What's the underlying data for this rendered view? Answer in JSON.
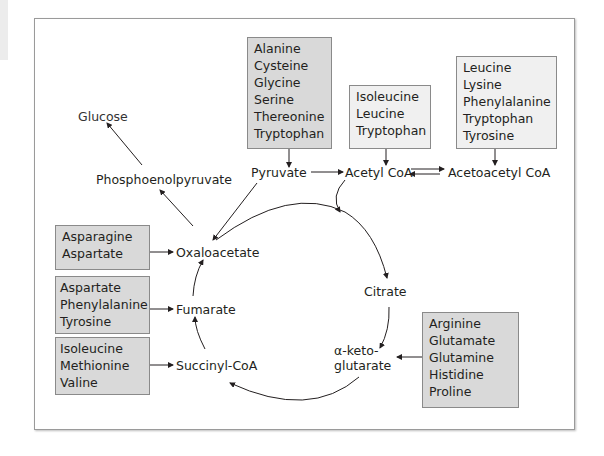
{
  "diagram": {
    "type": "metabolic-pathway",
    "nodes": {
      "glucose": "Glucose",
      "phosphoenolpyruvate": "Phosphoenolpyruvate",
      "pyruvate": "Pyruvate",
      "acetyl_coa": "Acetyl CoA",
      "acetoacetyl_coa": "Acetoacetyl CoA",
      "oxaloacetate": "Oxaloacetate",
      "citrate": "Citrate",
      "alpha_ketoglutarate_line1": "α-keto-",
      "alpha_ketoglutarate_line2": "glutarate",
      "succinyl_coa": "Succinyl-CoA",
      "fumarate": "Fumarate"
    },
    "boxes": {
      "pyruvate_sources": [
        "Alanine",
        "Cysteine",
        "Glycine",
        "Serine",
        "Thereonine",
        "Tryptophan"
      ],
      "acetyl_coa_sources": [
        "Isoleucine",
        "Leucine",
        "Tryptophan"
      ],
      "acetoacetyl_coa_sources": [
        "Leucine",
        "Lysine",
        "Phenylalanine",
        "Tryptophan",
        "Tyrosine"
      ],
      "oxaloacetate_sources": [
        "Asparagine",
        "Aspartate"
      ],
      "fumarate_sources": [
        "Aspartate",
        "Phenylalanine",
        "Tyrosine"
      ],
      "succinyl_coa_sources": [
        "Isoleucine",
        "Methionine",
        "Valine"
      ],
      "alpha_ketoglutarate_sources": [
        "Arginine",
        "Glutamate",
        "Glutamine",
        "Histidine",
        "Proline"
      ]
    },
    "edges": [
      {
        "from": "Alanine/Cysteine/Glycine/Serine/Thereonine/Tryptophan",
        "to": "Pyruvate"
      },
      {
        "from": "Isoleucine/Leucine/Tryptophan",
        "to": "Acetyl CoA"
      },
      {
        "from": "Leucine/Lysine/Phenylalanine/Tryptophan/Tyrosine",
        "to": "Acetoacetyl CoA"
      },
      {
        "from": "Pyruvate",
        "to": "Acetyl CoA"
      },
      {
        "from": "Acetyl CoA",
        "to": "Acetoacetyl CoA",
        "bidirectional": true
      },
      {
        "from": "Pyruvate",
        "to": "Oxaloacetate"
      },
      {
        "from": "Oxaloacetate",
        "to": "Phosphoenolpyruvate"
      },
      {
        "from": "Phosphoenolpyruvate",
        "to": "Glucose"
      },
      {
        "from": "Acetyl CoA",
        "to": "Citrate"
      },
      {
        "from": "Oxaloacetate",
        "to": "Citrate"
      },
      {
        "from": "Citrate",
        "to": "α-ketoglutarate"
      },
      {
        "from": "α-ketoglutarate",
        "to": "Succinyl-CoA"
      },
      {
        "from": "Succinyl-CoA",
        "to": "Fumarate"
      },
      {
        "from": "Fumarate",
        "to": "Oxaloacetate"
      },
      {
        "from": "Asparagine/Aspartate",
        "to": "Oxaloacetate"
      },
      {
        "from": "Aspartate/Phenylalanine/Tyrosine",
        "to": "Fumarate"
      },
      {
        "from": "Isoleucine/Methionine/Valine",
        "to": "Succinyl-CoA"
      },
      {
        "from": "Arginine/Glutamate/Glutamine/Histidine/Proline",
        "to": "α-ketoglutarate"
      }
    ],
    "colors": {
      "box_fill": "#d9d9d9",
      "box_border": "#8a8a8a",
      "line": "#231f20",
      "frame": "#9a9a9a"
    }
  }
}
